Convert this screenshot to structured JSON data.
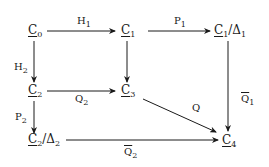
{
  "nodes": {
    "c0": {
      "base": "C",
      "sub": "0",
      "suffix": "",
      "suffix_sub": ""
    },
    "c1": {
      "base": "C",
      "sub": "1",
      "suffix": "",
      "suffix_sub": ""
    },
    "c1d": {
      "base": "C",
      "sub": "1",
      "suffix": "/Δ",
      "suffix_sub": "1"
    },
    "c2": {
      "base": "C",
      "sub": "2",
      "suffix": "",
      "suffix_sub": ""
    },
    "c3": {
      "base": "C",
      "sub": "3",
      "suffix": "",
      "suffix_sub": ""
    },
    "c2d": {
      "base": "C",
      "sub": "2",
      "suffix": "/Δ",
      "suffix_sub": "2"
    },
    "c4": {
      "base": "C",
      "sub": "4",
      "suffix": "",
      "suffix_sub": ""
    }
  },
  "arrows": {
    "h1": {
      "from": "C0",
      "to": "C1",
      "label": "H",
      "label_sub": "1",
      "bar": false
    },
    "p1": {
      "from": "C1",
      "to": "C1/Δ1",
      "label": "P",
      "label_sub": "1",
      "bar": false
    },
    "h2": {
      "from": "C0",
      "to": "C2",
      "label": "H",
      "label_sub": "2",
      "bar": false
    },
    "c1c3": {
      "from": "C1",
      "to": "C3",
      "label": "",
      "label_sub": "",
      "bar": false
    },
    "q1b": {
      "from": "C1/Δ1",
      "to": "C4",
      "label": "Q",
      "label_sub": "1",
      "bar": true
    },
    "q2": {
      "from": "C2",
      "to": "C3",
      "label": "Q",
      "label_sub": "2",
      "bar": false
    },
    "p2": {
      "from": "C2",
      "to": "C2/Δ2",
      "label": "P",
      "label_sub": "2",
      "bar": false
    },
    "q": {
      "from": "C3",
      "to": "C4",
      "label": "Q",
      "label_sub": "",
      "bar": false
    },
    "q2b": {
      "from": "C2/Δ2",
      "to": "C4",
      "label": "Q",
      "label_sub": "2",
      "bar": true
    }
  }
}
